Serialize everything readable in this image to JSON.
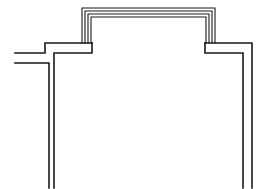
{
  "diagram": {
    "stroke_color": "#1a1a1a",
    "background": "#ffffff",
    "elements": [
      {
        "name": "left-wall-outer",
        "type": "double-line-wall"
      },
      {
        "name": "left-wall-inner",
        "type": "double-line-wall"
      },
      {
        "name": "top-bay-outline",
        "type": "multi-line-bay",
        "line_count": 4
      },
      {
        "name": "right-wall",
        "type": "double-line-wall"
      }
    ]
  }
}
